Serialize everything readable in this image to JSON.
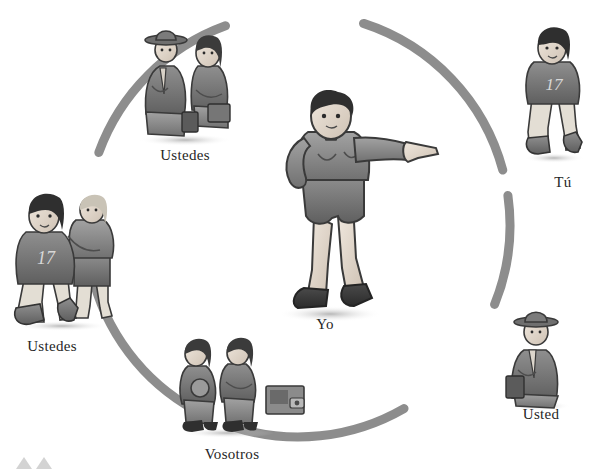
{
  "diagram": {
    "type": "radial-pronoun-diagram",
    "background_color": "#ffffff",
    "arc_color": "#8d8d8d",
    "arc_width_px": 9,
    "label_color": "#262626",
    "center": {
      "x": 298,
      "y": 225
    },
    "radius": 212
  },
  "center_figure": {
    "label": "Yo",
    "description": "girl with short dark hair, long-sleeve tunic and shorts, pointing to the right with her right arm extended",
    "pointing_direction": "right",
    "label_position": {
      "x": 320,
      "y": 322
    }
  },
  "nodes": [
    {
      "id": "ustedes-top",
      "label": "Ustedes",
      "description": "man in hat and suit standing beside a seated woman with a briefcase",
      "figure_kind": "man-hat-and-woman",
      "count": 2,
      "angle_deg": 300,
      "label_position": {
        "x": 184,
        "y": 155
      }
    },
    {
      "id": "tu",
      "label": "Tú",
      "description": "young athlete kneeling in a jersey numbered 17",
      "figure_kind": "athlete-jersey",
      "jersey_number": "17",
      "count": 1,
      "angle_deg": 340,
      "label_position": {
        "x": 563,
        "y": 182
      }
    },
    {
      "id": "usted",
      "label": "Usted",
      "description": "businessman wearing a hat and suit, carrying a briefcase",
      "figure_kind": "man-hat-briefcase",
      "count": 1,
      "angle_deg": 30,
      "label_position": {
        "x": 540,
        "y": 414
      }
    },
    {
      "id": "vosotros",
      "label": "Vosotros",
      "description": "two children standing side by side, one holding a disc, next to a small radio box",
      "figure_kind": "two-children-radio",
      "count": 2,
      "angle_deg": 95,
      "label_position": {
        "x": 232,
        "y": 454
      }
    },
    {
      "id": "ustedes-left",
      "label": "Ustedes",
      "description": "two athletes, the front one kneeling in jersey number 17, the other standing with arms crossed",
      "figure_kind": "two-athletes",
      "jersey_number": "17",
      "count": 2,
      "angle_deg": 185,
      "label_position": {
        "x": 52,
        "y": 346
      }
    }
  ],
  "arc_segments": [
    {
      "id": "arc-top",
      "start_deg": 288,
      "end_deg": 345
    },
    {
      "id": "arc-right-upper",
      "start_deg": 352,
      "end_deg": 22
    },
    {
      "id": "arc-bottom",
      "start_deg": 60,
      "end_deg": 108
    },
    {
      "id": "arc-left-lower",
      "start_deg": 122,
      "end_deg": 170
    },
    {
      "id": "arc-left-upper",
      "start_deg": 200,
      "end_deg": 250
    }
  ],
  "corner_marks": {
    "description": "two small faint gray triangles clipped at the bottom-left edge",
    "color": "#d3d3d3",
    "count": 2
  }
}
